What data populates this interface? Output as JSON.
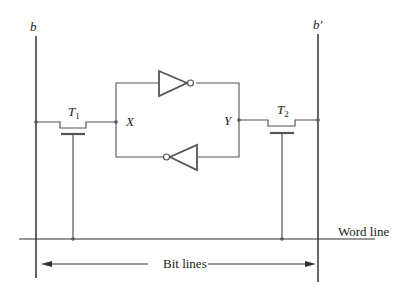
{
  "diagram": {
    "labels": {
      "bit_line_left": "b",
      "bit_line_right": "b′",
      "transistor_left": "T",
      "transistor_left_sub": "1",
      "transistor_right": "T",
      "transistor_right_sub": "2",
      "node_left": "X",
      "node_right": "Y",
      "word_line": "Word line",
      "bit_lines": "Bit lines"
    },
    "colors": {
      "line": "#555555",
      "bit_line": "#333333",
      "text": "#222222"
    },
    "components": [
      "bit line b",
      "bit line b′",
      "transistor T1",
      "transistor T2",
      "inverter (top, left-to-right)",
      "inverter (bottom, right-to-left)",
      "word line"
    ]
  }
}
